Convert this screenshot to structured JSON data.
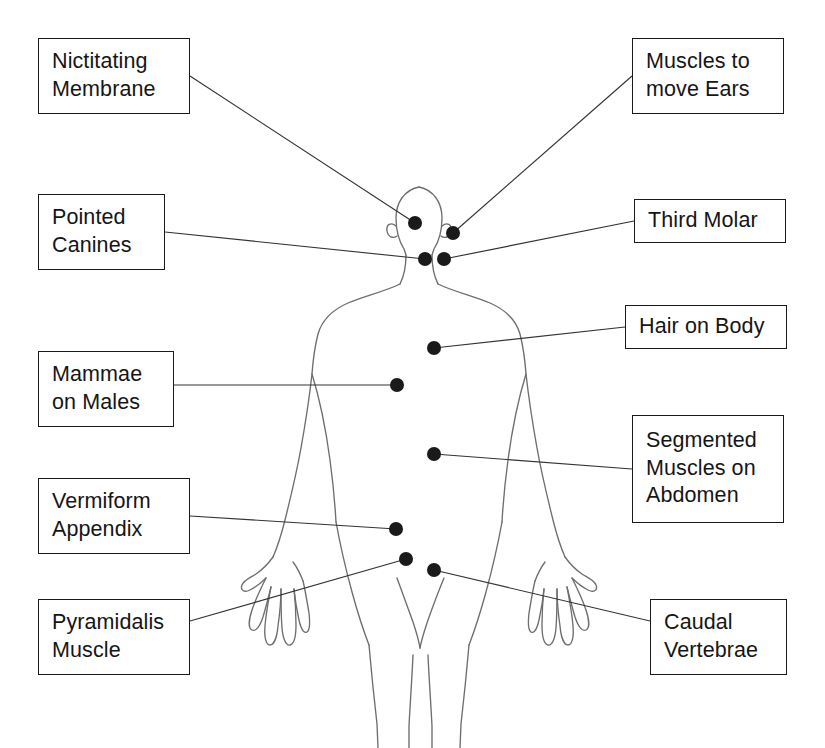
{
  "diagram": {
    "type": "labeled-anatomical-diagram",
    "background_color": "#ffffff",
    "line_color": "#333333",
    "marker_color": "#1a1a1a",
    "box_border_color": "#1a1a1a",
    "text_color": "#151515",
    "figure": {
      "name": "human-body-outline",
      "description": "Front-facing outline silhouette of a standing human figure with arms angled slightly away from the body and hands with splayed fingers"
    },
    "labels": [
      {
        "id": "nictitating-membrane",
        "text": "Nictitating\nMembrane",
        "box": {
          "x": 38,
          "y": 38,
          "width": 152,
          "height": 76
        },
        "marker": {
          "x": 415,
          "y": 223
        },
        "side": "left"
      },
      {
        "id": "muscles-to-move-ears",
        "text": "Muscles to\nmove Ears",
        "box": {
          "x": 632,
          "y": 38,
          "width": 152,
          "height": 76
        },
        "marker": {
          "x": 453,
          "y": 233
        },
        "side": "right"
      },
      {
        "id": "pointed-canines",
        "text": "Pointed\nCanines",
        "box": {
          "x": 38,
          "y": 194,
          "width": 127,
          "height": 76
        },
        "marker": {
          "x": 425,
          "y": 259
        },
        "side": "left"
      },
      {
        "id": "third-molar",
        "text": "Third Molar",
        "box": {
          "x": 634,
          "y": 199,
          "width": 152,
          "height": 44
        },
        "marker": {
          "x": 444,
          "y": 259
        },
        "side": "right"
      },
      {
        "id": "hair-on-body",
        "text": "Hair on Body",
        "box": {
          "x": 625,
          "y": 305,
          "width": 162,
          "height": 44
        },
        "marker": {
          "x": 434,
          "y": 348
        },
        "side": "right"
      },
      {
        "id": "mammae-on-males",
        "text": "Mammae\non Males",
        "box": {
          "x": 38,
          "y": 351,
          "width": 136,
          "height": 76
        },
        "marker": {
          "x": 397,
          "y": 385
        },
        "side": "left"
      },
      {
        "id": "segmented-muscles-on-abdomen",
        "text": "Segmented\nMuscles on\nAbdomen",
        "box": {
          "x": 632,
          "y": 415,
          "width": 152,
          "height": 108
        },
        "marker": {
          "x": 434,
          "y": 454
        },
        "side": "right"
      },
      {
        "id": "vermiform-appendix",
        "text": "Vermiform\nAppendix",
        "box": {
          "x": 38,
          "y": 478,
          "width": 152,
          "height": 76
        },
        "marker": {
          "x": 396,
          "y": 529
        },
        "side": "left"
      },
      {
        "id": "pyramidalis-muscle",
        "text": "Pyramidalis\nMuscle",
        "box": {
          "x": 38,
          "y": 599,
          "width": 152,
          "height": 76
        },
        "marker": {
          "x": 406,
          "y": 559
        },
        "side": "left"
      },
      {
        "id": "caudal-vertebrae",
        "text": "Caudal\nVertebrae",
        "box": {
          "x": 650,
          "y": 599,
          "width": 137,
          "height": 76
        },
        "marker": {
          "x": 434,
          "y": 570
        },
        "side": "right"
      }
    ]
  }
}
